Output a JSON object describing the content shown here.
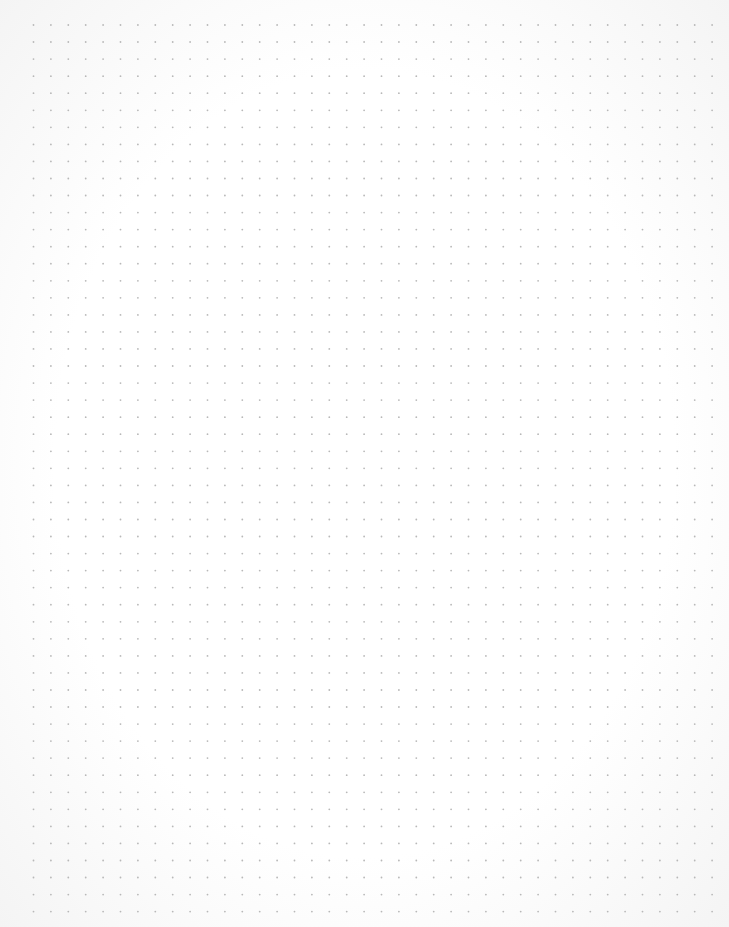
{
  "page": {
    "type": "dot-grid paper",
    "caption": "Dot grid paper"
  },
  "grid": {
    "columns": 40,
    "rows": 53,
    "dot_color": "#b8b8b8",
    "background_color": "#ffffff"
  }
}
